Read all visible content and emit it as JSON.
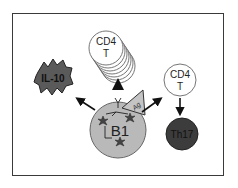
{
  "diagram": {
    "center_cell": {
      "label": "B1",
      "fill": "#b9b9b9"
    },
    "antigen": {
      "label": "Ag",
      "fill": "#c4c4c4"
    },
    "cytokine": {
      "label": "IL-10",
      "fill": "#555555"
    },
    "proliferating_t": {
      "label_line1": "CD4",
      "label_line2": "T"
    },
    "differentiating_t": {
      "label_line1": "CD4",
      "label_line2": "T"
    },
    "th17": {
      "label": "Th17",
      "fill": "#3c3c3c"
    },
    "colors": {
      "frame": "#3a3a3a",
      "arrow": "#111111",
      "cell_outline": "#555555"
    }
  }
}
